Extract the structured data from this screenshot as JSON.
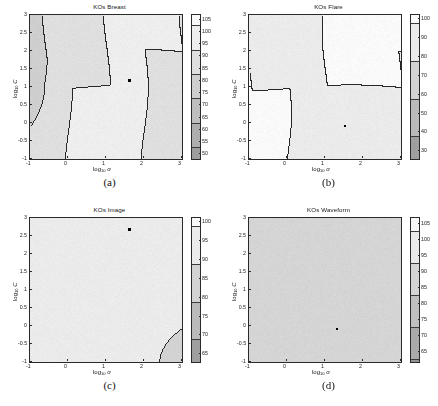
{
  "figure": {
    "panel_count": 4,
    "axis": {
      "xlabel_main": "log",
      "xlabel_sub": "10",
      "xlabel_var": "σ",
      "ylabel_main": "log",
      "ylabel_sub": "10",
      "ylabel_var": "C",
      "xticks": [
        "-1",
        "0",
        "1",
        "2",
        "3"
      ],
      "yticks": [
        "3",
        "2.5",
        "2",
        "1.5",
        "1",
        "0.5",
        "0",
        "-0.5",
        "-1"
      ],
      "xlim": [
        -1,
        3
      ],
      "ylim": [
        -1,
        3
      ]
    }
  },
  "panels": [
    {
      "id": "a",
      "caption": "(a)",
      "title": "KOs Breast",
      "colorbar": {
        "ticks": [
          105,
          100,
          95,
          90,
          85,
          80,
          75,
          70,
          65,
          60,
          55,
          50
        ],
        "min": 48,
        "max": 107
      },
      "marker": {
        "x": 1.62,
        "y": 1.18
      },
      "chart_data": {
        "type": "heatmap",
        "title": "KOs Breast",
        "xlabel": "log10 sigma",
        "ylabel": "log10 C",
        "xlim": [
          -1,
          3
        ],
        "ylim": [
          -1,
          3
        ],
        "zlim": [
          48,
          107
        ],
        "contour_levels": [
          50,
          55,
          60,
          65,
          70,
          75,
          80,
          85,
          90,
          95,
          100,
          105
        ],
        "grid": false,
        "legend": "colorbar-right",
        "x": [
          -1,
          -0.5,
          0,
          0.5,
          1,
          1.5,
          2,
          2.5,
          3
        ],
        "y": [
          -1,
          -0.5,
          0,
          0.5,
          1,
          1.5,
          2,
          2.5,
          3
        ],
        "values": [
          [
            93,
            99,
            100,
            100,
            100,
            96,
            79,
            66,
            58
          ],
          [
            93,
            99,
            100,
            100,
            100,
            95,
            78,
            64,
            56
          ],
          [
            94,
            100,
            100,
            100,
            99,
            92,
            74,
            61,
            54
          ],
          [
            95,
            100,
            100,
            100,
            98,
            88,
            70,
            58,
            52
          ],
          [
            95,
            100,
            100,
            100,
            97,
            85,
            66,
            56,
            51
          ],
          [
            96,
            100,
            100,
            100,
            96,
            82,
            63,
            54,
            50
          ],
          [
            96,
            100,
            100,
            100,
            95,
            79,
            61,
            52,
            49
          ],
          [
            96,
            100,
            100,
            100,
            94,
            77,
            59,
            51,
            49
          ],
          [
            96,
            100,
            100,
            100,
            93,
            75,
            58,
            50,
            48
          ]
        ]
      }
    },
    {
      "id": "b",
      "caption": "(b)",
      "title": "KOs Flare",
      "colorbar": {
        "ticks": [
          100,
          90,
          80,
          70,
          60,
          50,
          40,
          30
        ],
        "min": 26,
        "max": 102
      },
      "marker": {
        "x": 1.52,
        "y": -0.08
      },
      "chart_data": {
        "type": "heatmap",
        "title": "KOs Flare",
        "xlabel": "log10 sigma",
        "ylabel": "log10 C",
        "xlim": [
          -1,
          3
        ],
        "ylim": [
          -1,
          3
        ],
        "zlim": [
          26,
          102
        ],
        "contour_levels": [
          30,
          40,
          50,
          60,
          70,
          80,
          90,
          100
        ],
        "grid": false,
        "legend": "colorbar-right",
        "x": [
          -1,
          -0.5,
          0,
          0.5,
          1,
          1.5,
          2,
          2.5,
          3
        ],
        "y": [
          -1,
          -0.5,
          0,
          0.5,
          1,
          1.5,
          2,
          2.5,
          3
        ],
        "values": [
          [
            100,
            94,
            100,
            100,
            100,
            100,
            100,
            96,
            78
          ],
          [
            100,
            92,
            100,
            100,
            100,
            100,
            96,
            82,
            62
          ],
          [
            100,
            100,
            100,
            100,
            100,
            96,
            82,
            62,
            44
          ],
          [
            100,
            100,
            94,
            100,
            98,
            84,
            64,
            46,
            34
          ],
          [
            100,
            100,
            93,
            100,
            92,
            72,
            52,
            38,
            30
          ],
          [
            100,
            100,
            93,
            100,
            88,
            64,
            46,
            33,
            28
          ],
          [
            100,
            100,
            93,
            100,
            84,
            58,
            41,
            30,
            27
          ],
          [
            100,
            100,
            93,
            100,
            81,
            54,
            38,
            29,
            26
          ],
          [
            100,
            100,
            93,
            100,
            79,
            51,
            36,
            28,
            26
          ]
        ]
      }
    },
    {
      "id": "c",
      "caption": "(c)",
      "title": "KOs Image",
      "colorbar": {
        "ticks": [
          100,
          95,
          90,
          85,
          80,
          75,
          70,
          65
        ],
        "min": 63,
        "max": 101
      },
      "marker": {
        "x": 1.62,
        "y": 2.68
      },
      "chart_data": {
        "type": "heatmap",
        "title": "KOs Image",
        "xlabel": "log10 sigma",
        "ylabel": "log10 C",
        "xlim": [
          -1,
          3
        ],
        "ylim": [
          -1,
          3
        ],
        "zlim": [
          63,
          101
        ],
        "contour_levels": [
          65,
          70,
          75,
          80,
          85,
          90,
          95,
          100
        ],
        "grid": false,
        "legend": "colorbar-right",
        "x": [
          -1,
          -0.5,
          0,
          0.5,
          1,
          1.5,
          2,
          2.5,
          3
        ],
        "y": [
          -1,
          -0.5,
          0,
          0.5,
          1,
          1.5,
          2,
          2.5,
          3
        ],
        "values": [
          [
            99,
            99,
            99,
            99,
            99,
            97,
            96,
            95,
            95
          ],
          [
            99,
            99,
            99,
            99,
            98,
            96,
            94,
            93,
            93
          ],
          [
            97,
            97,
            98,
            98,
            97,
            94,
            90,
            88,
            88
          ],
          [
            96,
            96,
            97,
            97,
            95,
            90,
            84,
            80,
            79
          ],
          [
            96,
            96,
            97,
            96,
            92,
            84,
            76,
            71,
            70
          ],
          [
            96,
            96,
            96,
            95,
            89,
            78,
            70,
            66,
            65
          ],
          [
            96,
            96,
            96,
            94,
            85,
            73,
            66,
            64,
            64
          ],
          [
            96,
            96,
            96,
            93,
            82,
            70,
            64,
            63,
            64
          ],
          [
            96,
            96,
            96,
            92,
            80,
            68,
            64,
            63,
            65
          ]
        ]
      }
    },
    {
      "id": "d",
      "caption": "(d)",
      "title": "KOs Waveform",
      "colorbar": {
        "ticks": [
          105,
          100,
          95,
          90,
          85,
          80,
          75,
          70,
          65
        ],
        "min": 62,
        "max": 107
      },
      "marker": {
        "x": 1.32,
        "y": -0.08
      },
      "chart_data": {
        "type": "heatmap",
        "title": "KOs Waveform",
        "xlabel": "log10 sigma",
        "ylabel": "log10 C",
        "xlim": [
          -1,
          3
        ],
        "ylim": [
          -1,
          3
        ],
        "zlim": [
          62,
          107
        ],
        "contour_levels": [
          65,
          70,
          75,
          80,
          85,
          90,
          95,
          100,
          105
        ],
        "grid": false,
        "legend": "colorbar-right",
        "x": [
          -1,
          -0.5,
          0,
          0.5,
          1,
          1.5,
          2,
          2.5,
          3
        ],
        "y": [
          -1,
          -0.5,
          0,
          0.5,
          1,
          1.5,
          2,
          2.5,
          3
        ],
        "values": [
          [
            99,
            99,
            99,
            99,
            99,
            96,
            86,
            74,
            66
          ],
          [
            99,
            99,
            99,
            99,
            98,
            93,
            80,
            69,
            63
          ],
          [
            99,
            99,
            99,
            99,
            97,
            89,
            75,
            65,
            62
          ],
          [
            99,
            99,
            99,
            99,
            96,
            86,
            72,
            63,
            62
          ],
          [
            99,
            99,
            99,
            99,
            96,
            84,
            70,
            63,
            62
          ],
          [
            99,
            99,
            99,
            99,
            96,
            83,
            70,
            63,
            63
          ],
          [
            99,
            99,
            99,
            99,
            96,
            83,
            70,
            64,
            64
          ],
          [
            99,
            99,
            99,
            99,
            96,
            83,
            71,
            65,
            66
          ],
          [
            99,
            99,
            99,
            99,
            96,
            84,
            72,
            66,
            68
          ]
        ]
      }
    }
  ]
}
